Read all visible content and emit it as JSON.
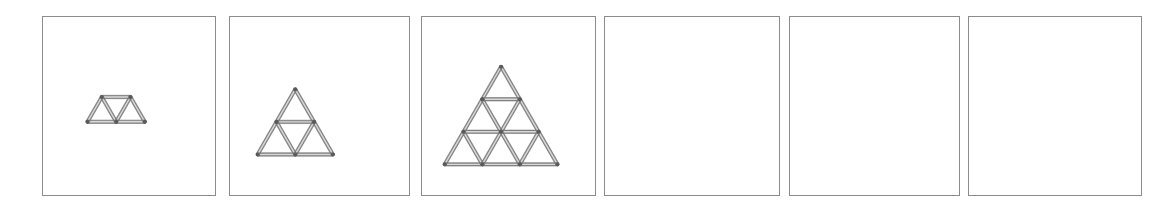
{
  "page": {
    "background_color": "#ffffff",
    "width": 1173,
    "height": 207,
    "panel_count": 6
  },
  "style": {
    "panel_border_color": "#8c8c8c",
    "panel_fill_color": "#ffffff",
    "match_outline_color": "#6f6f6f",
    "match_shadow_color": "#8a8a8a",
    "match_highlight_color": "#d8d8d8",
    "node_color": "#5a5a5a"
  },
  "panels": [
    {
      "index": 1,
      "name": "panel-1",
      "label": "",
      "state": "filled",
      "figure": "trapezoid-row",
      "rows": 1,
      "upward_triangles": 2,
      "downward_triangles": 1,
      "total_triangles": 3,
      "matchstick_count": 5,
      "x": 42,
      "y": 16,
      "width": 174,
      "height": 180,
      "unit": 29,
      "origin_x": 87,
      "origin_y": 122,
      "segments": [
        [
          0,
          0,
          2,
          0
        ],
        [
          0.5,
          -1,
          1.5,
          -1
        ],
        [
          0,
          0,
          0.5,
          -1
        ],
        [
          0.5,
          -1,
          1,
          0
        ],
        [
          1,
          0,
          1.5,
          -1
        ],
        [
          1.5,
          -1,
          2,
          0
        ]
      ],
      "nodes": [
        [
          0,
          0
        ],
        [
          1,
          0
        ],
        [
          2,
          0
        ],
        [
          0.5,
          -1
        ],
        [
          1.5,
          -1
        ]
      ]
    },
    {
      "index": 2,
      "name": "panel-2",
      "label": "",
      "state": "filled",
      "figure": "triangle-grid",
      "rows": 2,
      "upward_triangles": 4,
      "downward_triangles": 1,
      "total_triangles": 5,
      "matchstick_count": 9,
      "x": 229,
      "y": 16,
      "width": 181,
      "height": 180,
      "unit": 38,
      "origin_x": 257,
      "origin_y": 155,
      "segments": [
        [
          0,
          0,
          1,
          0
        ],
        [
          1,
          0,
          2,
          0
        ],
        [
          0.5,
          -1,
          1.5,
          -1
        ],
        [
          0,
          0,
          0.5,
          -1
        ],
        [
          0.5,
          -1,
          1,
          -2
        ],
        [
          1,
          0,
          1.5,
          -1
        ],
        [
          0.5,
          -1,
          1,
          0
        ],
        [
          1.5,
          -1,
          2,
          0
        ],
        [
          1,
          -2,
          1.5,
          -1
        ]
      ],
      "nodes": [
        [
          0,
          0
        ],
        [
          1,
          0
        ],
        [
          2,
          0
        ],
        [
          0.5,
          -1
        ],
        [
          1.5,
          -1
        ],
        [
          1,
          -2
        ]
      ]
    },
    {
      "index": 3,
      "name": "panel-3",
      "label": "",
      "state": "filled",
      "figure": "triangle-grid",
      "rows": 3,
      "upward_triangles": 9,
      "downward_triangles": 3,
      "total_triangles": 12,
      "matchstick_count": 18,
      "x": 421,
      "y": 16,
      "width": 175,
      "height": 180,
      "unit": 38,
      "origin_x": 444,
      "origin_y": 165,
      "segments": [
        [
          0,
          0,
          1,
          0
        ],
        [
          1,
          0,
          2,
          0
        ],
        [
          2,
          0,
          3,
          0
        ],
        [
          0.5,
          -1,
          1.5,
          -1
        ],
        [
          1.5,
          -1,
          2.5,
          -1
        ],
        [
          1,
          -2,
          2,
          -2
        ],
        [
          0,
          0,
          0.5,
          -1
        ],
        [
          0.5,
          -1,
          1,
          -2
        ],
        [
          1,
          -2,
          1.5,
          -3
        ],
        [
          1,
          0,
          1.5,
          -1
        ],
        [
          1.5,
          -1,
          2,
          -2
        ],
        [
          2,
          0,
          2.5,
          -1
        ],
        [
          0.5,
          -1,
          1,
          0
        ],
        [
          1,
          -2,
          1.5,
          -1
        ],
        [
          1.5,
          -3,
          2,
          -2
        ],
        [
          1.5,
          -1,
          2,
          0
        ],
        [
          2,
          -2,
          2.5,
          -1
        ],
        [
          2.5,
          -1,
          3,
          0
        ]
      ],
      "nodes": [
        [
          0,
          0
        ],
        [
          1,
          0
        ],
        [
          2,
          0
        ],
        [
          3,
          0
        ],
        [
          0.5,
          -1
        ],
        [
          1.5,
          -1
        ],
        [
          2.5,
          -1
        ],
        [
          1,
          -2
        ],
        [
          2,
          -2
        ],
        [
          1.5,
          -3
        ]
      ]
    },
    {
      "index": 4,
      "name": "panel-4",
      "label": "",
      "state": "empty",
      "figure": "none",
      "rows": 0,
      "upward_triangles": 0,
      "downward_triangles": 0,
      "total_triangles": 0,
      "matchstick_count": 0,
      "x": 604,
      "y": 16,
      "width": 176,
      "height": 180,
      "unit": 0,
      "origin_x": 0,
      "origin_y": 0,
      "segments": [],
      "nodes": []
    },
    {
      "index": 5,
      "name": "panel-5",
      "label": "",
      "state": "empty",
      "figure": "none",
      "rows": 0,
      "upward_triangles": 0,
      "downward_triangles": 0,
      "total_triangles": 0,
      "matchstick_count": 0,
      "x": 789,
      "y": 16,
      "width": 171,
      "height": 180,
      "unit": 0,
      "origin_x": 0,
      "origin_y": 0,
      "segments": [],
      "nodes": []
    },
    {
      "index": 6,
      "name": "panel-6",
      "label": "",
      "state": "empty",
      "figure": "none",
      "rows": 0,
      "upward_triangles": 0,
      "downward_triangles": 0,
      "total_triangles": 0,
      "matchstick_count": 0,
      "x": 968,
      "y": 16,
      "width": 174,
      "height": 180,
      "unit": 0,
      "origin_x": 0,
      "origin_y": 0,
      "segments": [],
      "nodes": []
    }
  ]
}
